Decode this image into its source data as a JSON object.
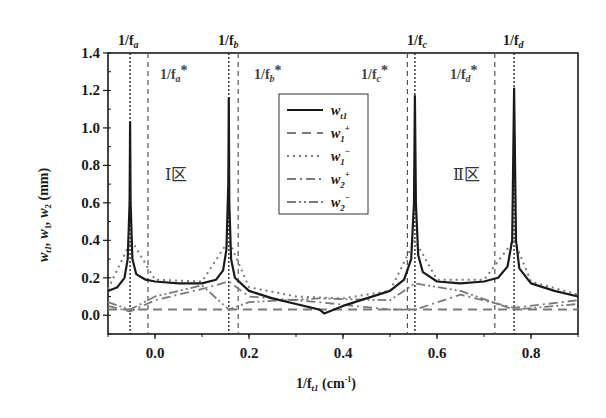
{
  "chart_data": {
    "type": "line",
    "title": "",
    "xlabel": "1/f_t1 (cm^-1)",
    "ylabel": "w_t1, w_1, w_2 (mm)",
    "xlim": [
      -0.1,
      0.9
    ],
    "ylim": [
      -0.1,
      1.4
    ],
    "x_ticks": [
      0.0,
      0.2,
      0.4,
      0.6,
      0.8
    ],
    "x_tick_labels": [
      "0.0",
      "0.2",
      "0.4",
      "0.6",
      "0.8"
    ],
    "y_ticks": [
      0.0,
      0.2,
      0.4,
      0.6,
      0.8,
      1.0,
      1.2,
      1.4
    ],
    "y_tick_labels": [
      "0.0",
      "0.2",
      "0.4",
      "0.6",
      "0.8",
      "1.0",
      "1.2",
      "1.4"
    ],
    "grid": false,
    "legend_position": "upper center (inside plot)",
    "legend": [
      {
        "label": "w_t1",
        "style": "solid",
        "color": "#1a1a1a"
      },
      {
        "label": "w_1^+",
        "style": "dashed",
        "color": "#777777"
      },
      {
        "label": "w_1^-",
        "style": "dotted",
        "color": "#777777"
      },
      {
        "label": "w_2^+",
        "style": "dash-dot",
        "color": "#777777"
      },
      {
        "label": "w_2^-",
        "style": "dash-dot-dot",
        "color": "#777777"
      }
    ],
    "vertical_markers": [
      {
        "label": "1/f_a",
        "x": -0.053,
        "style": "dotted",
        "position": "top"
      },
      {
        "label": "1/f_a*",
        "x": -0.015,
        "style": "dashed",
        "position": "inside"
      },
      {
        "label": "1/f_b",
        "x": 0.157,
        "style": "dotted",
        "position": "top"
      },
      {
        "label": "1/f_b*",
        "x": 0.177,
        "style": "dashed",
        "position": "inside"
      },
      {
        "label": "1/f_c*",
        "x": 0.537,
        "style": "dashed",
        "position": "inside"
      },
      {
        "label": "1/f_c",
        "x": 0.553,
        "style": "dotted",
        "position": "top"
      },
      {
        "label": "1/f_d*",
        "x": 0.723,
        "style": "dashed",
        "position": "inside"
      },
      {
        "label": "1/f_d",
        "x": 0.764,
        "style": "dotted",
        "position": "top"
      }
    ],
    "annotations": [
      {
        "text": "Ⅰ区",
        "x": 0.05,
        "y": 0.85
      },
      {
        "text": "Ⅱ区",
        "x": 0.67,
        "y": 0.85
      }
    ],
    "series": [
      {
        "name": "w_t1",
        "x": [
          -0.1,
          -0.08,
          -0.065,
          -0.058,
          -0.054,
          -0.053,
          -0.052,
          -0.048,
          -0.04,
          -0.02,
          0.0,
          0.05,
          0.1,
          0.13,
          0.145,
          0.152,
          0.156,
          0.157,
          0.158,
          0.162,
          0.17,
          0.2,
          0.25,
          0.3,
          0.35,
          0.36,
          0.4,
          0.45,
          0.5,
          0.53,
          0.545,
          0.551,
          0.553,
          0.555,
          0.56,
          0.57,
          0.6,
          0.65,
          0.7,
          0.73,
          0.75,
          0.76,
          0.764,
          0.768,
          0.775,
          0.8,
          0.85,
          0.9
        ],
        "values": [
          0.13,
          0.15,
          0.2,
          0.3,
          0.6,
          1.03,
          0.6,
          0.3,
          0.22,
          0.19,
          0.18,
          0.17,
          0.17,
          0.19,
          0.24,
          0.35,
          0.7,
          1.16,
          0.6,
          0.3,
          0.2,
          0.13,
          0.09,
          0.06,
          0.03,
          0.01,
          0.05,
          0.09,
          0.13,
          0.19,
          0.3,
          0.6,
          1.17,
          0.6,
          0.32,
          0.23,
          0.18,
          0.17,
          0.18,
          0.2,
          0.26,
          0.4,
          1.21,
          0.4,
          0.25,
          0.17,
          0.13,
          0.1
        ]
      },
      {
        "name": "w_1^+",
        "x": [
          -0.1,
          0.0,
          0.1,
          0.2,
          0.3,
          0.4,
          0.5,
          0.6,
          0.7,
          0.8,
          0.9
        ],
        "values": [
          0.03,
          0.03,
          0.03,
          0.03,
          0.03,
          0.03,
          0.03,
          0.03,
          0.03,
          0.03,
          0.03
        ]
      },
      {
        "name": "w_1^-",
        "x": [
          -0.1,
          -0.05,
          0.0,
          0.1,
          0.157,
          0.2,
          0.3,
          0.4,
          0.5,
          0.553,
          0.6,
          0.7,
          0.764,
          0.8,
          0.9
        ],
        "values": [
          0.14,
          0.4,
          0.19,
          0.18,
          0.4,
          0.15,
          0.1,
          0.09,
          0.13,
          0.4,
          0.19,
          0.19,
          0.4,
          0.18,
          0.11
        ]
      },
      {
        "name": "w_2^+",
        "x": [
          -0.1,
          -0.053,
          0.0,
          0.1,
          0.157,
          0.2,
          0.35,
          0.5,
          0.553,
          0.65,
          0.764,
          0.9
        ],
        "values": [
          0.05,
          0.02,
          0.08,
          0.14,
          0.18,
          0.1,
          0.07,
          0.03,
          0.03,
          0.11,
          0.04,
          0.08
        ]
      },
      {
        "name": "w_2^-",
        "x": [
          -0.1,
          -0.053,
          0.0,
          0.1,
          0.157,
          0.2,
          0.35,
          0.5,
          0.553,
          0.65,
          0.764,
          0.9
        ],
        "values": [
          0.07,
          0.03,
          0.1,
          0.16,
          0.03,
          0.07,
          0.09,
          0.08,
          0.17,
          0.13,
          0.03,
          0.06
        ]
      }
    ]
  },
  "labels": {
    "top_markers": {
      "a": "1/f",
      "a_sub": "a",
      "b": "1/f",
      "b_sub": "b",
      "c": "1/f",
      "c_sub": "c",
      "d": "1/f",
      "d_sub": "d"
    },
    "star_markers": {
      "a": "1/f",
      "a_sub": "a",
      "b": "1/f",
      "b_sub": "b",
      "c": "1/f",
      "c_sub": "c",
      "d": "1/f",
      "d_sub": "d",
      "star": "*"
    },
    "region_1": "Ⅰ区",
    "region_2": "Ⅱ区",
    "xlabel_main": "1/f",
    "xlabel_sub": "t1",
    "xlabel_unit": " (cm",
    "xlabel_exp": "-1",
    "xlabel_close": ")",
    "ylabel_text": "w",
    "ylabel_sub1": "t1",
    "ylabel_mid1": ", w",
    "ylabel_sub2": "1",
    "ylabel_mid2": ", w",
    "ylabel_sub3": "2",
    "ylabel_unit": " (mm)",
    "legend_items": [
      {
        "base": "w",
        "sub": "t1",
        "sup": ""
      },
      {
        "base": "w",
        "sub": "1",
        "sup": "+"
      },
      {
        "base": "w",
        "sub": "1",
        "sup": "−"
      },
      {
        "base": "w",
        "sub": "2",
        "sup": "+"
      },
      {
        "base": "w",
        "sub": "2",
        "sup": "−"
      }
    ]
  }
}
